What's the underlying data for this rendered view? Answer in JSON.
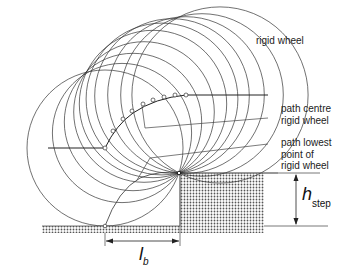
{
  "diagram": {
    "labels": {
      "rigid_wheel": "rigid wheel",
      "path_centre_line1": "path centre",
      "path_centre_line2": "rigid wheel",
      "path_lowest_line1": "path lowest",
      "path_lowest_line2": "point of",
      "path_lowest_line3": "rigid wheel",
      "h_symbol": "h",
      "h_subscript": "step",
      "l_symbol": "l",
      "l_subscript": "b"
    },
    "geometry": {
      "step_corner": [
        179,
        173
      ],
      "ground_y": 226,
      "step_top_y": 173,
      "wheel_count": 10,
      "wheel_centers": [
        [
          105,
          148
        ],
        [
          122,
          133
        ],
        [
          133,
          122
        ],
        [
          144,
          112
        ],
        [
          153,
          104
        ],
        [
          162,
          99
        ],
        [
          172,
          96
        ],
        [
          186,
          95
        ],
        [
          202,
          95
        ],
        [
          220,
          95
        ]
      ]
    },
    "colors": {
      "line": "#333333",
      "hatch": "#555555",
      "background": "#ffffff"
    }
  }
}
